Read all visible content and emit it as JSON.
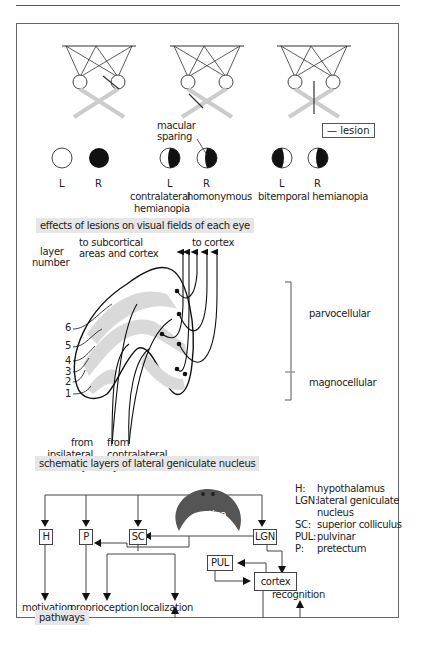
{
  "panel1": {
    "caption": "effects of lesions on visual fields of each eye",
    "legend_label": "lesion",
    "macular_label_1": "macular",
    "macular_label_2": "sparing",
    "groups": [
      {
        "left_label": "L",
        "right_label": "R",
        "caption_1": "",
        "caption_2": "",
        "left_field": "intact",
        "right_field": "blind"
      },
      {
        "left_label": "L",
        "right_label": "R",
        "caption_1": "contralateral homonymous",
        "caption_2": "hemianopia",
        "left_field": "right-half-blind",
        "right_field": "right-half-blind"
      },
      {
        "left_label": "L",
        "right_label": "R",
        "caption_1": "bitemporal hemianopia",
        "caption_2": "",
        "left_field": "left-half-blind",
        "right_field": "right-half-blind"
      }
    ],
    "caption_contralateral": "contralateral",
    "caption_homonymous": "homonymous",
    "caption_hemianopia": "hemianopia",
    "caption_bitemporal": "bitemporal hemianopia"
  },
  "panel2": {
    "caption": "schematic layers of lateral geniculate nucleus",
    "layer_heading_1": "layer",
    "layer_heading_2": "number",
    "layers": [
      "6",
      "5",
      "4",
      "3",
      "2",
      "1"
    ],
    "to_subcortical_1": "to subcortical",
    "to_subcortical_2": "areas and cortex",
    "to_cortex": "to cortex",
    "from_ipsi_1": "from",
    "from_ipsi_2": "ipsilateral",
    "from_ipsi_3": "eye",
    "from_contra_1": "from",
    "from_contra_2": "contralateral",
    "from_contra_3": "eye",
    "parvocellular": "parvocellular",
    "magnocellular": "magnocellular"
  },
  "panel3": {
    "caption": "pathways",
    "retina": "retina",
    "boxes": {
      "H": "H",
      "P": "P",
      "SC": "SC",
      "LGN": "LGN",
      "PUL": "PUL",
      "cortex": "cortex"
    },
    "outputs": {
      "motivation": "motivation",
      "proprioception": "proprioception",
      "localization": "localization",
      "recognition": "recognition"
    },
    "key": [
      {
        "abbr": "H:",
        "desc": "hypothalamus"
      },
      {
        "abbr": "LGN:",
        "desc": "lateral geniculate"
      },
      {
        "abbr": "",
        "desc": "nucleus"
      },
      {
        "abbr": "SC:",
        "desc": "superior colliculus"
      },
      {
        "abbr": "PUL:",
        "desc": "pulvinar"
      },
      {
        "abbr": "P:",
        "desc": "pretectum"
      }
    ]
  },
  "colors": {
    "line": "#222222",
    "gray_pathway": "#cccccc",
    "caption_bg": "#e6e6e6",
    "lgn_gray": "#d9d9d9"
  }
}
